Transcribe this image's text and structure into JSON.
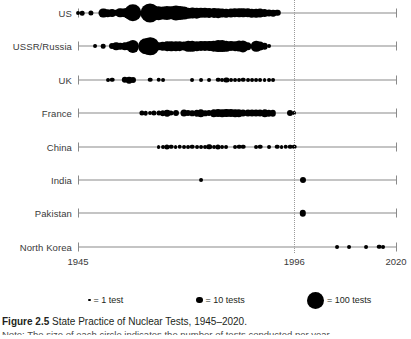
{
  "figure": {
    "number_label": "Figure 2.5",
    "title": "State Practice of Nuclear Tests, 1945–2020.",
    "note": "Note: The size of each circle indicates the number of tests conducted per year."
  },
  "axis": {
    "start_year": 1945,
    "end_year": 2020,
    "tick_labels": [
      "1945",
      "1996",
      "2020"
    ],
    "tick_years": [
      1945,
      1996,
      2020
    ],
    "reference_line_year": 1996,
    "reference_line_style": "dotted"
  },
  "legend": {
    "items": [
      {
        "label": "= 1 test",
        "size_px": 2.5,
        "value": 1
      },
      {
        "label": "= 10 tests",
        "size_px": 6.5,
        "value": 10
      },
      {
        "label": "= 100 tests",
        "size_px": 17,
        "value": 100
      }
    ]
  },
  "chart_data": {
    "type": "scatter",
    "title": "State Practice of Nuclear Tests, 1945–2020.",
    "xlabel": "",
    "ylabel": "",
    "xlim": [
      1945,
      2020
    ],
    "grid": false,
    "legend_position": "below",
    "note": "Bubble size encodes number of nuclear tests conducted in that year.",
    "categories": [
      "US",
      "USSR/Russia",
      "UK",
      "France",
      "China",
      "India",
      "Pakistan",
      "North Korea"
    ],
    "series": [
      {
        "name": "US",
        "points": [
          {
            "x": 1945,
            "v": 1
          },
          {
            "x": 1946,
            "v": 2
          },
          {
            "x": 1948,
            "v": 3
          },
          {
            "x": 1951,
            "v": 16
          },
          {
            "x": 1952,
            "v": 10
          },
          {
            "x": 1953,
            "v": 11
          },
          {
            "x": 1954,
            "v": 6
          },
          {
            "x": 1955,
            "v": 18
          },
          {
            "x": 1956,
            "v": 18
          },
          {
            "x": 1957,
            "v": 32
          },
          {
            "x": 1958,
            "v": 77
          },
          {
            "x": 1959,
            "v": 0
          },
          {
            "x": 1960,
            "v": 0
          },
          {
            "x": 1961,
            "v": 10
          },
          {
            "x": 1962,
            "v": 96
          },
          {
            "x": 1963,
            "v": 47
          },
          {
            "x": 1964,
            "v": 45
          },
          {
            "x": 1965,
            "v": 38
          },
          {
            "x": 1966,
            "v": 48
          },
          {
            "x": 1967,
            "v": 42
          },
          {
            "x": 1968,
            "v": 56
          },
          {
            "x": 1969,
            "v": 46
          },
          {
            "x": 1970,
            "v": 39
          },
          {
            "x": 1971,
            "v": 24
          },
          {
            "x": 1972,
            "v": 27
          },
          {
            "x": 1973,
            "v": 24
          },
          {
            "x": 1974,
            "v": 22
          },
          {
            "x": 1975,
            "v": 22
          },
          {
            "x": 1976,
            "v": 20
          },
          {
            "x": 1977,
            "v": 20
          },
          {
            "x": 1978,
            "v": 19
          },
          {
            "x": 1979,
            "v": 15
          },
          {
            "x": 1980,
            "v": 14
          },
          {
            "x": 1981,
            "v": 16
          },
          {
            "x": 1982,
            "v": 18
          },
          {
            "x": 1983,
            "v": 18
          },
          {
            "x": 1984,
            "v": 18
          },
          {
            "x": 1985,
            "v": 17
          },
          {
            "x": 1986,
            "v": 14
          },
          {
            "x": 1987,
            "v": 14
          },
          {
            "x": 1988,
            "v": 15
          },
          {
            "x": 1989,
            "v": 11
          },
          {
            "x": 1990,
            "v": 8
          },
          {
            "x": 1991,
            "v": 7
          },
          {
            "x": 1992,
            "v": 6
          }
        ]
      },
      {
        "name": "USSR/Russia",
        "points": [
          {
            "x": 1949,
            "v": 1
          },
          {
            "x": 1951,
            "v": 2
          },
          {
            "x": 1953,
            "v": 5
          },
          {
            "x": 1954,
            "v": 10
          },
          {
            "x": 1955,
            "v": 6
          },
          {
            "x": 1956,
            "v": 9
          },
          {
            "x": 1957,
            "v": 16
          },
          {
            "x": 1958,
            "v": 34
          },
          {
            "x": 1961,
            "v": 59
          },
          {
            "x": 1962,
            "v": 79
          },
          {
            "x": 1963,
            "v": 0
          },
          {
            "x": 1964,
            "v": 9
          },
          {
            "x": 1965,
            "v": 14
          },
          {
            "x": 1966,
            "v": 18
          },
          {
            "x": 1967,
            "v": 17
          },
          {
            "x": 1968,
            "v": 17
          },
          {
            "x": 1969,
            "v": 19
          },
          {
            "x": 1970,
            "v": 16
          },
          {
            "x": 1971,
            "v": 23
          },
          {
            "x": 1972,
            "v": 24
          },
          {
            "x": 1973,
            "v": 17
          },
          {
            "x": 1974,
            "v": 21
          },
          {
            "x": 1975,
            "v": 21
          },
          {
            "x": 1976,
            "v": 21
          },
          {
            "x": 1977,
            "v": 24
          },
          {
            "x": 1978,
            "v": 31
          },
          {
            "x": 1979,
            "v": 31
          },
          {
            "x": 1980,
            "v": 24
          },
          {
            "x": 1981,
            "v": 21
          },
          {
            "x": 1982,
            "v": 19
          },
          {
            "x": 1983,
            "v": 25
          },
          {
            "x": 1984,
            "v": 27
          },
          {
            "x": 1985,
            "v": 10
          },
          {
            "x": 1986,
            "v": 0
          },
          {
            "x": 1987,
            "v": 23
          },
          {
            "x": 1988,
            "v": 16
          },
          {
            "x": 1989,
            "v": 7
          },
          {
            "x": 1990,
            "v": 1
          }
        ]
      },
      {
        "name": "UK",
        "points": [
          {
            "x": 1952,
            "v": 1
          },
          {
            "x": 1953,
            "v": 2
          },
          {
            "x": 1956,
            "v": 6
          },
          {
            "x": 1957,
            "v": 7
          },
          {
            "x": 1958,
            "v": 5
          },
          {
            "x": 1962,
            "v": 2
          },
          {
            "x": 1964,
            "v": 2
          },
          {
            "x": 1965,
            "v": 1
          },
          {
            "x": 1972,
            "v": 1
          },
          {
            "x": 1974,
            "v": 1
          },
          {
            "x": 1976,
            "v": 1
          },
          {
            "x": 1978,
            "v": 2
          },
          {
            "x": 1979,
            "v": 1
          },
          {
            "x": 1980,
            "v": 3
          },
          {
            "x": 1981,
            "v": 1
          },
          {
            "x": 1982,
            "v": 1
          },
          {
            "x": 1983,
            "v": 1
          },
          {
            "x": 1984,
            "v": 2
          },
          {
            "x": 1985,
            "v": 1
          },
          {
            "x": 1986,
            "v": 1
          },
          {
            "x": 1987,
            "v": 1
          },
          {
            "x": 1988,
            "v": 1
          },
          {
            "x": 1989,
            "v": 1
          },
          {
            "x": 1990,
            "v": 1
          },
          {
            "x": 1991,
            "v": 1
          }
        ]
      },
      {
        "name": "France",
        "points": [
          {
            "x": 1960,
            "v": 3
          },
          {
            "x": 1961,
            "v": 2
          },
          {
            "x": 1962,
            "v": 1
          },
          {
            "x": 1963,
            "v": 3
          },
          {
            "x": 1964,
            "v": 3
          },
          {
            "x": 1965,
            "v": 4
          },
          {
            "x": 1966,
            "v": 7
          },
          {
            "x": 1967,
            "v": 3
          },
          {
            "x": 1968,
            "v": 5
          },
          {
            "x": 1970,
            "v": 8
          },
          {
            "x": 1971,
            "v": 5
          },
          {
            "x": 1972,
            "v": 4
          },
          {
            "x": 1973,
            "v": 6
          },
          {
            "x": 1974,
            "v": 9
          },
          {
            "x": 1975,
            "v": 4
          },
          {
            "x": 1976,
            "v": 5
          },
          {
            "x": 1977,
            "v": 9
          },
          {
            "x": 1978,
            "v": 11
          },
          {
            "x": 1979,
            "v": 10
          },
          {
            "x": 1980,
            "v": 12
          },
          {
            "x": 1981,
            "v": 12
          },
          {
            "x": 1982,
            "v": 10
          },
          {
            "x": 1983,
            "v": 9
          },
          {
            "x": 1984,
            "v": 8
          },
          {
            "x": 1985,
            "v": 8
          },
          {
            "x": 1986,
            "v": 8
          },
          {
            "x": 1987,
            "v": 8
          },
          {
            "x": 1988,
            "v": 8
          },
          {
            "x": 1989,
            "v": 9
          },
          {
            "x": 1990,
            "v": 6
          },
          {
            "x": 1991,
            "v": 6
          },
          {
            "x": 1995,
            "v": 5
          },
          {
            "x": 1996,
            "v": 1
          }
        ]
      },
      {
        "name": "China",
        "points": [
          {
            "x": 1964,
            "v": 1
          },
          {
            "x": 1965,
            "v": 1
          },
          {
            "x": 1966,
            "v": 3
          },
          {
            "x": 1967,
            "v": 2
          },
          {
            "x": 1968,
            "v": 1
          },
          {
            "x": 1969,
            "v": 2
          },
          {
            "x": 1970,
            "v": 1
          },
          {
            "x": 1971,
            "v": 1
          },
          {
            "x": 1972,
            "v": 2
          },
          {
            "x": 1973,
            "v": 1
          },
          {
            "x": 1974,
            "v": 1
          },
          {
            "x": 1975,
            "v": 1
          },
          {
            "x": 1976,
            "v": 4
          },
          {
            "x": 1977,
            "v": 1
          },
          {
            "x": 1978,
            "v": 3
          },
          {
            "x": 1979,
            "v": 1
          },
          {
            "x": 1980,
            "v": 1
          },
          {
            "x": 1982,
            "v": 1
          },
          {
            "x": 1983,
            "v": 2
          },
          {
            "x": 1984,
            "v": 2
          },
          {
            "x": 1987,
            "v": 1
          },
          {
            "x": 1988,
            "v": 2
          },
          {
            "x": 1990,
            "v": 1
          },
          {
            "x": 1992,
            "v": 2
          },
          {
            "x": 1993,
            "v": 1
          },
          {
            "x": 1994,
            "v": 2
          },
          {
            "x": 1995,
            "v": 2
          },
          {
            "x": 1996,
            "v": 2
          }
        ]
      },
      {
        "name": "India",
        "points": [
          {
            "x": 1974,
            "v": 1
          },
          {
            "x": 1998,
            "v": 5
          }
        ]
      },
      {
        "name": "Pakistan",
        "points": [
          {
            "x": 1998,
            "v": 6
          }
        ]
      },
      {
        "name": "North Korea",
        "points": [
          {
            "x": 2006,
            "v": 1
          },
          {
            "x": 2009,
            "v": 1
          },
          {
            "x": 2013,
            "v": 1
          },
          {
            "x": 2016,
            "v": 2
          },
          {
            "x": 2017,
            "v": 1
          }
        ]
      }
    ]
  },
  "colors": {
    "dot": "#000000",
    "axis": "#8a8a8a",
    "refline": "#9a9a9a",
    "text": "#231f20",
    "label": "#3a3a3a",
    "background": "#ffffff"
  }
}
